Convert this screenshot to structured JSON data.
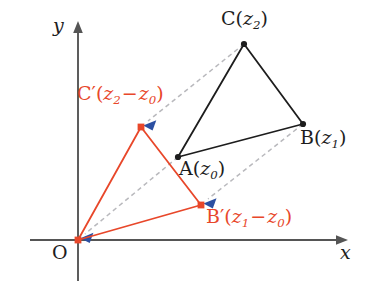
{
  "figure": {
    "background_color": "#ffffff",
    "width": 370,
    "height": 291
  },
  "colors": {
    "axis": "#555555",
    "black_triangle": "#1d1d1d",
    "red_triangle": "#e8472a",
    "dashed_guide": "#b9b9bd",
    "arrowhead": "#2b4fa2",
    "label_black": "#1d1d1d",
    "label_red": "#e8472a"
  },
  "axes": {
    "x_label": "x",
    "y_label": "y",
    "origin_label": "O",
    "origin_point": {
      "x": 78,
      "y": 240
    },
    "x_axis": {
      "x1": 30,
      "y1": 240,
      "x2": 347,
      "y2": 240
    },
    "y_axis": {
      "x1": 78,
      "y1": 278,
      "x2": 78,
      "y2": 22
    }
  },
  "points": {
    "A": {
      "label_main": "A",
      "label_var": "z",
      "label_sub": "0",
      "x": 178,
      "y": 157,
      "color": "#1d1d1d"
    },
    "B": {
      "label_main": "B",
      "label_var": "z",
      "label_sub": "1",
      "x": 303,
      "y": 124,
      "color": "#1d1d1d"
    },
    "C": {
      "label_main": "C",
      "label_var": "z",
      "label_sub": "2",
      "x": 244,
      "y": 44,
      "color": "#1d1d1d"
    },
    "O": {
      "label_main": "O",
      "x": 78,
      "y": 240,
      "color": "#e8472a"
    },
    "Bp": {
      "label_main": "B",
      "prime": "′",
      "var1": "z",
      "sub1": "1",
      "op": "−",
      "var2": "z",
      "sub2": "0",
      "x": 201,
      "y": 205,
      "color": "#e8472a"
    },
    "Cp": {
      "label_main": "C",
      "prime": "′",
      "var1": "z",
      "sub1": "2",
      "op": "−",
      "var2": "z",
      "sub2": "0",
      "x": 141,
      "y": 127,
      "color": "#e8472a"
    }
  },
  "labels": {
    "C_text": "C(z2)",
    "B_text": "B(z1)",
    "A_text": "A(z0)",
    "Cp_text": "C′(z2−z0)",
    "Bp_text": "B′(z1−z0)",
    "O_text": "O",
    "x_text": "x",
    "y_text": "y"
  },
  "shapes": {
    "black_triangle": {
      "name": "triangle-ABC",
      "vertices": [
        [
          178,
          157
        ],
        [
          303,
          124
        ],
        [
          244,
          44
        ]
      ],
      "stroke": "#1d1d1d",
      "stroke_width": 1.7
    },
    "red_triangle": {
      "name": "triangle-OB'C'",
      "vertices": [
        [
          78,
          240
        ],
        [
          201,
          205
        ],
        [
          141,
          127
        ]
      ],
      "stroke": "#e8472a",
      "stroke_width": 1.7
    }
  },
  "guides": [
    {
      "name": "guide-A-to-O",
      "from": [
        178,
        157
      ],
      "to": [
        78,
        240
      ],
      "arrow_at": "to"
    },
    {
      "name": "guide-B-to-Bprime",
      "from": [
        303,
        124
      ],
      "to": [
        201,
        205
      ],
      "arrow_at": "to"
    },
    {
      "name": "guide-C-to-Cprime",
      "from": [
        244,
        44
      ],
      "to": [
        141,
        127
      ],
      "arrow_at": "to"
    }
  ]
}
